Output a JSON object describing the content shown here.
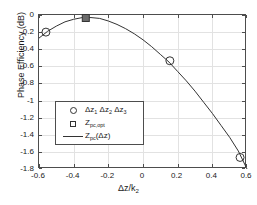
{
  "chart_data": {
    "type": "line",
    "title": "",
    "xlabel": "Δz/k₂",
    "xlabel_main": "Δz/k",
    "xlabel_sub": "2",
    "ylabel": "Phase Efficiency (dB)",
    "xlim": [
      -0.6,
      0.6
    ],
    "ylim": [
      -1.8,
      0
    ],
    "grid": true,
    "legend_position": "center-left",
    "xticks": [
      -0.6,
      -0.4,
      -0.2,
      0,
      0.2,
      0.4,
      0.6
    ],
    "xticklabels": [
      "-0.6",
      "-0.4",
      "-0.2",
      "0",
      "0.2",
      "0.4",
      "0.6"
    ],
    "yticks": [
      0,
      -0.2,
      -0.4,
      -0.6,
      -0.8,
      -1,
      -1.2,
      -1.4,
      -1.6,
      -1.8
    ],
    "yticklabels": [
      "0",
      "-0.2",
      "-0.4",
      "-0.6",
      "-0.8",
      "-1",
      "-1.2",
      "-1.4",
      "-1.6",
      "-1.8"
    ],
    "series": [
      {
        "name": "Z_pc(Δz)",
        "type": "line",
        "color": "#333333",
        "x": [
          -0.6,
          -0.55,
          -0.5,
          -0.45,
          -0.4,
          -0.35,
          -0.3,
          -0.25,
          -0.2,
          -0.15,
          -0.1,
          -0.05,
          0.0,
          0.05,
          0.1,
          0.15,
          0.2,
          0.25,
          0.3,
          0.35,
          0.4,
          0.45,
          0.5,
          0.55,
          0.6
        ],
        "y": [
          -0.27,
          -0.19,
          -0.13,
          -0.08,
          -0.05,
          -0.03,
          -0.03,
          -0.04,
          -0.07,
          -0.11,
          -0.16,
          -0.22,
          -0.29,
          -0.37,
          -0.46,
          -0.55,
          -0.66,
          -0.77,
          -0.89,
          -1.02,
          -1.15,
          -1.29,
          -1.43,
          -1.59,
          -1.8
        ]
      },
      {
        "name": "Δz₁ Δz₂ Δz₃",
        "type": "scatter",
        "marker": "circle",
        "color": "#333333",
        "x": [
          -0.56,
          0.155,
          0.56
        ],
        "y": [
          -0.2,
          -0.535,
          -1.665
        ]
      },
      {
        "name": "Z_pc,opt",
        "type": "scatter",
        "marker": "square",
        "color": "#333333",
        "x": [
          -0.33
        ],
        "y": [
          -0.035
        ]
      }
    ]
  },
  "legend": {
    "items": [
      {
        "key": "circle",
        "label": "Δz₁ Δz₂ Δz₃",
        "parts": [
          {
            "base": "Δz",
            "sub": "1"
          },
          {
            "base": "Δz",
            "sub": "2"
          },
          {
            "base": "Δz",
            "sub": "3"
          }
        ]
      },
      {
        "key": "square",
        "label": "Zₚₑ,ₒₚₜ",
        "base": "Z",
        "sub": "pc,opt"
      },
      {
        "key": "line",
        "label": "Zₚₑ(Δz)",
        "base": "Z",
        "sub": "pc",
        "tail": "(Δz)"
      }
    ]
  },
  "axes": {
    "ylabel": "Phase Efficiency (dB)"
  }
}
